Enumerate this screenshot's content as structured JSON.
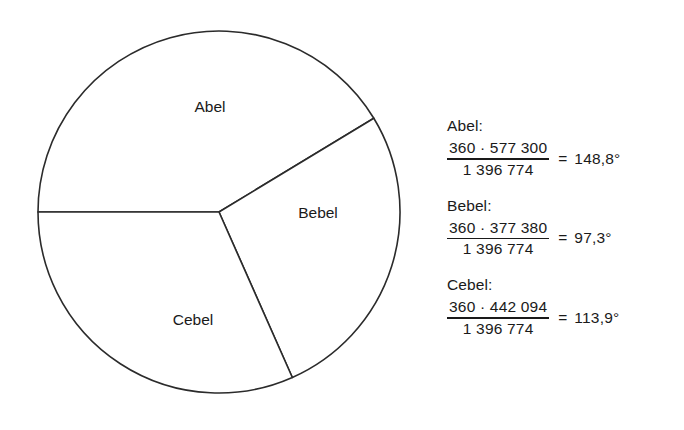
{
  "chart_data": {
    "type": "pie",
    "title": "",
    "categories": [
      "Abel",
      "Bebel",
      "Cebel"
    ],
    "values": [
      577300,
      377380,
      442094
    ],
    "angles_deg": [
      148.8,
      97.3,
      113.9
    ],
    "total": 1396774,
    "start_angle_deg": 180,
    "direction": "clockwise",
    "filled": false,
    "stroke_color": "#2b2b2b",
    "fill_color": "#ffffff",
    "legend": "none",
    "labels_inside_slices": true,
    "geometry": {
      "center_x": 219,
      "center_y": 212,
      "radius": 181
    },
    "slices": [
      {
        "name": "Abel",
        "value": 577300,
        "angle_deg": 148.8,
        "label": "Abel",
        "label_x": 210,
        "label_y": 108
      },
      {
        "name": "Bebel",
        "value": 377380,
        "angle_deg": 97.3,
        "label": "Bebel",
        "label_x": 318,
        "label_y": 214
      },
      {
        "name": "Cebel",
        "value": 442094,
        "angle_deg": 113.9,
        "label": "Cebel",
        "label_x": 193,
        "label_y": 321
      }
    ]
  },
  "calculations": {
    "items": [
      {
        "name": "Abel:",
        "numerator": "360 · 577 300",
        "denominator": "1 396 774",
        "equals": "=",
        "result": "148,8°"
      },
      {
        "name": "Bebel:",
        "numerator": "360 · 377 380",
        "denominator": "1 396 774",
        "equals": "=",
        "result": "97,3°"
      },
      {
        "name": "Cebel:",
        "numerator": "360 · 442 094",
        "denominator": "1 396 774",
        "equals": "=",
        "result": "113,9°"
      }
    ]
  }
}
